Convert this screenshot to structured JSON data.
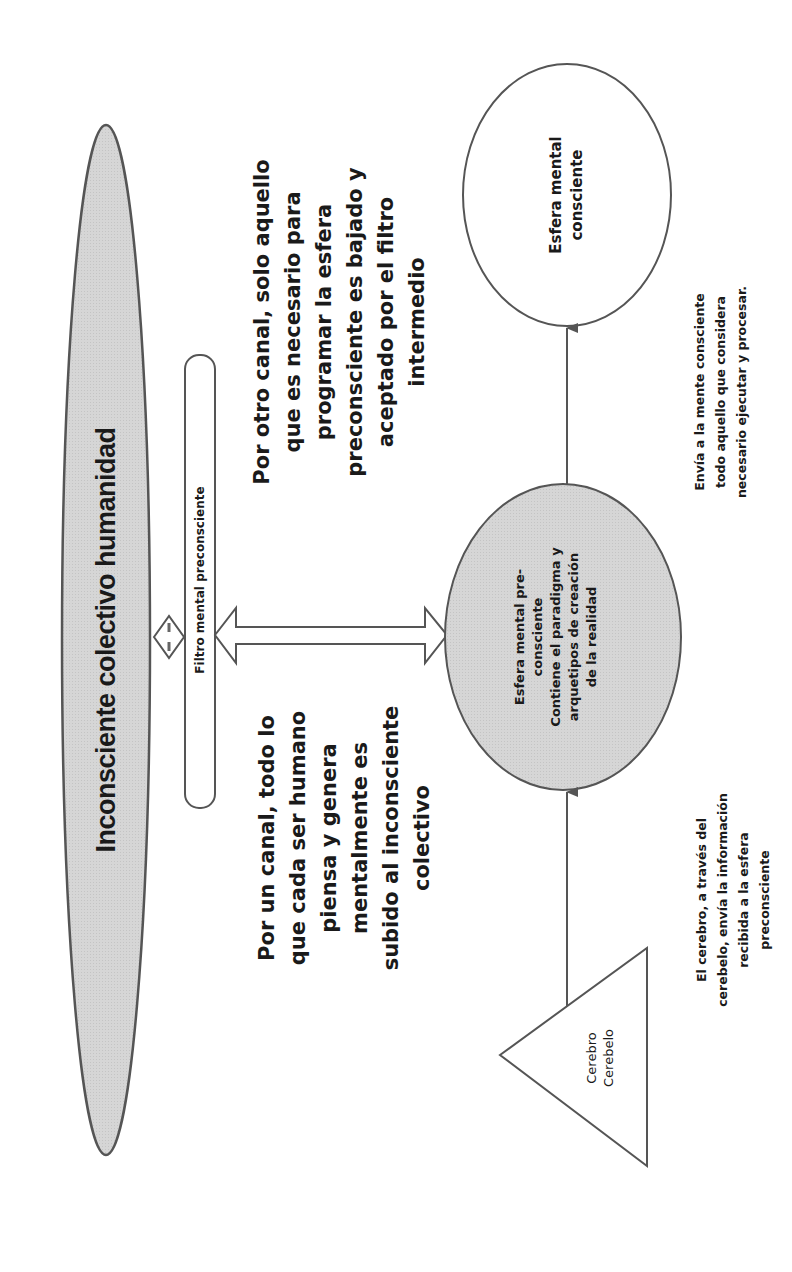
{
  "diagram": {
    "orientation": "rotated -90deg (text reads bottom-to-top)",
    "colors": {
      "stroke": "#555555",
      "gray_fill": "#d4d4d4",
      "white_fill": "#ffffff",
      "text": "#1a1a1a"
    },
    "nodes": {
      "collective": {
        "label": "Inconsciente colectivo humanidad",
        "shape": "ellipse",
        "fill": "gray"
      },
      "filter": {
        "label": "Filtro mental preconsciente",
        "shape": "rounded-rectangle"
      },
      "preconscious": {
        "lines": [
          "Esfera mental pre-",
          "consciente",
          "Contiene el paradigma y",
          "arquetipos de creación",
          "de la realidad"
        ],
        "shape": "circle",
        "fill": "gray"
      },
      "conscious": {
        "lines": [
          "Esfera mental",
          "consciente"
        ],
        "shape": "ellipse",
        "fill": "white"
      },
      "brain": {
        "lines": [
          "Cerebro",
          "Cerebelo"
        ],
        "shape": "triangle"
      }
    },
    "annotations": {
      "down_channel": {
        "lines": [
          "Por otro canal, solo aquello",
          "que es necesario para",
          "programar la esfera",
          "preconsciente es bajado y",
          "aceptado por el filtro",
          "intermedio"
        ]
      },
      "up_channel": {
        "lines": [
          "Por un canal, todo lo",
          "que cada ser humano",
          "piensa y genera",
          "mentalmente es",
          "subido al inconsciente",
          "colectivo"
        ]
      },
      "to_conscious": {
        "lines": [
          "Envía a la mente consciente",
          "todo aquello que considera",
          "necesario ejecutar y procesar."
        ]
      },
      "from_brain": {
        "lines": [
          "El cerebro, a través del",
          "cerebelo, envía la información",
          "recibida a la esfera",
          "preconsciente"
        ]
      }
    },
    "edges": [
      {
        "from": "collective",
        "to": "filter",
        "type": "double-arrow-small"
      },
      {
        "from": "filter",
        "to": "preconscious",
        "type": "double-arrow-block"
      },
      {
        "from": "preconscious",
        "to": "conscious",
        "type": "arrow"
      },
      {
        "from": "brain",
        "to": "preconscious",
        "type": "arrow"
      }
    ]
  }
}
